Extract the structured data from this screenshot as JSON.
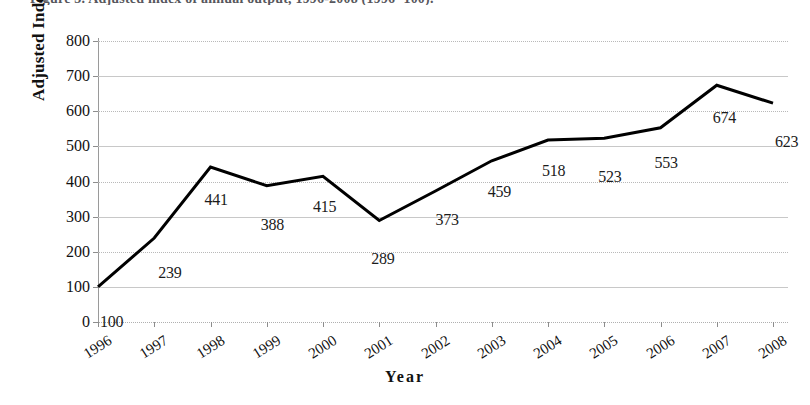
{
  "figure": {
    "cut_caption": "Figure 3. Adjusted index of annual output, 1996-2008 (1996=100).",
    "background": "#ffffff",
    "line_color": "#000000",
    "grid_color": "#bdbdbd"
  },
  "chart_data": {
    "type": "line",
    "title": "",
    "xlabel": "Year",
    "ylabel": "Adjusted Index (1996=100)",
    "categories": [
      "1996",
      "1997",
      "1998",
      "1999",
      "2000",
      "2001",
      "2002",
      "2003",
      "2004",
      "2005",
      "2006",
      "2007",
      "2008"
    ],
    "values": [
      100,
      239,
      441,
      388,
      415,
      289,
      373,
      459,
      518,
      523,
      553,
      674,
      623
    ],
    "data_labels": [
      "100",
      "239",
      "441",
      "388",
      "415",
      "289",
      "373",
      "459",
      "518",
      "523",
      "553",
      "674",
      "623"
    ],
    "ylim": [
      0,
      800
    ],
    "ytick_step": 100,
    "yticks": [
      "0",
      "100",
      "200",
      "300",
      "400",
      "500",
      "600",
      "700",
      "800"
    ],
    "grid": true,
    "legend": false,
    "markers": false,
    "line_width": 3
  }
}
